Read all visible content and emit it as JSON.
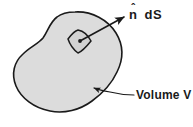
{
  "figure": {
    "background_color": "#ffffff",
    "blob": {
      "name": "volume-region",
      "fill_color": "#dcdcdc",
      "stroke_color": "#1a1a1a",
      "stroke_width": 1.6
    },
    "patch": {
      "name": "surface-element",
      "fill_color": "#d2d2d2",
      "stroke_color": "#1a1a1a",
      "stroke_width": 1.5,
      "center_dot_color": "#1a1a1a"
    },
    "normal_arrow": {
      "name": "normal-vector-arrow",
      "color": "#1a1a1a",
      "stroke_width": 1.6
    },
    "volume_leader": {
      "name": "volume-leader-line",
      "color": "#1a1a1a",
      "stroke_width": 1.2
    }
  },
  "labels": {
    "normal_symbol": "n",
    "normal_hat": "ˆ",
    "normal_area": "dS",
    "normal_full": "n̂  dS",
    "volume": "Volume V"
  }
}
